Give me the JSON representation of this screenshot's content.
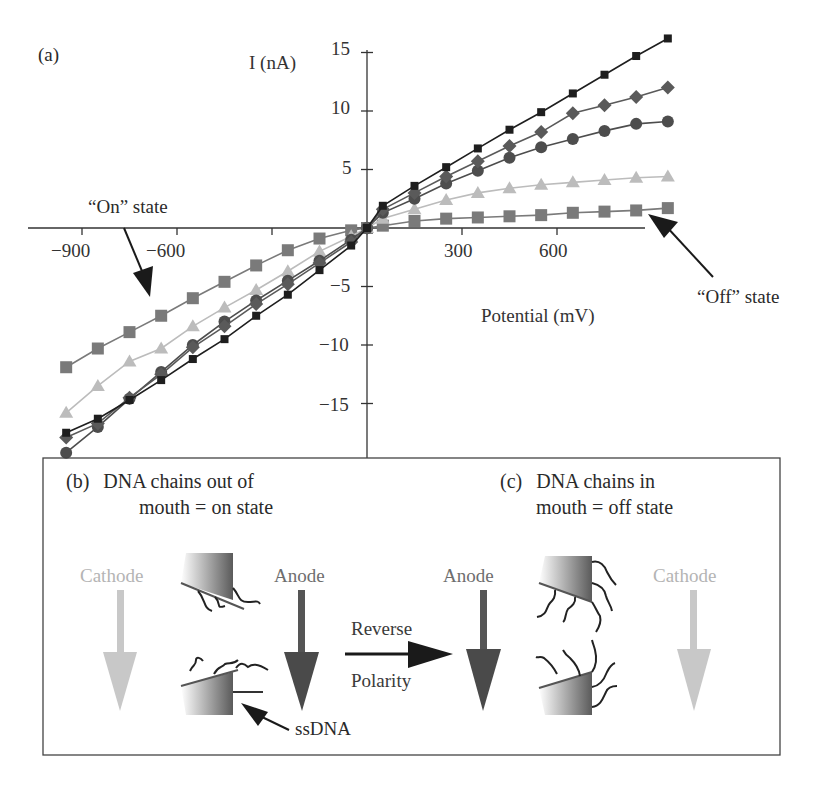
{
  "panel_a": {
    "label": "(a)",
    "y_axis_title": "I (nA)",
    "x_axis_title": "Potential (mV)",
    "y_ticks": [
      "15",
      "10",
      "5",
      "−5",
      "−10",
      "−15"
    ],
    "x_ticks": [
      "−900",
      "−600",
      "300",
      "600"
    ],
    "annotation_on": "“On” state",
    "annotation_off": "“Off” state"
  },
  "panel_b": {
    "label": "(b)",
    "title_line1": "DNA chains out of",
    "title_line2": "mouth = on state",
    "cathode_label": "Cathode",
    "anode_label": "Anode",
    "ssdna_label": "ssDNA"
  },
  "middle": {
    "reverse_label": "Reverse",
    "polarity_label": "Polarity"
  },
  "panel_c": {
    "label": "(c)",
    "title_line1": "DNA chains in",
    "title_line2": "mouth = off state",
    "anode_label": "Anode",
    "cathode_label": "Cathode"
  },
  "colors": {
    "series_black_square": "#1e1e1e",
    "series_diamond": "#5a5a5a",
    "series_circle": "#4d4d4d",
    "series_triangle": "#bcbcbc",
    "series_gray_square": "#7a7a7a",
    "cathode": "#c4c4c4",
    "anode": "#4a4a4a",
    "axis": "#333333"
  },
  "chart_data": {
    "type": "line",
    "title": "",
    "xlabel": "Potential (mV)",
    "ylabel": "I (nA)",
    "xlim": [
      -960,
      960
    ],
    "ylim": [
      -20,
      16
    ],
    "x_ticks": [
      -900,
      -600,
      300,
      600
    ],
    "y_ticks": [
      15,
      10,
      5,
      -5,
      -10,
      -15
    ],
    "grid": false,
    "legend": "none",
    "annotations": [
      {
        "text": "“On” state",
        "points_to": "negative-potential branch"
      },
      {
        "text": "“Off” state",
        "points_to": "gray-square series at positive potential"
      }
    ],
    "x": [
      -950,
      -850,
      -750,
      -650,
      -550,
      -450,
      -350,
      -250,
      -150,
      -50,
      0,
      50,
      150,
      250,
      350,
      450,
      550,
      650,
      750,
      850,
      950
    ],
    "series": [
      {
        "name": "black squares",
        "marker": "square-small",
        "color": "#1e1e1e",
        "values": [
          -17.5,
          -16.3,
          -14.7,
          -13.0,
          -11.2,
          -9.5,
          -7.5,
          -5.7,
          -3.6,
          -1.5,
          0,
          1.9,
          3.6,
          5.2,
          6.8,
          8.4,
          9.9,
          11.5,
          13.1,
          14.7,
          16.2
        ]
      },
      {
        "name": "diamonds",
        "marker": "diamond",
        "color": "#5a5a5a",
        "values": [
          -17.9,
          -16.7,
          -14.5,
          -12.5,
          -10.2,
          -8.4,
          -6.5,
          -4.8,
          -3.0,
          -1.2,
          0,
          1.6,
          3.0,
          4.4,
          5.7,
          7.0,
          8.2,
          9.8,
          10.5,
          11.2,
          12.0
        ]
      },
      {
        "name": "circles",
        "marker": "circle",
        "color": "#4d4d4d",
        "values": [
          -19.2,
          -17.0,
          -14.6,
          -12.3,
          -10.0,
          -8.0,
          -6.2,
          -4.5,
          -2.8,
          -1.0,
          0,
          1.3,
          2.5,
          3.8,
          4.9,
          6.0,
          6.9,
          7.6,
          8.3,
          8.9,
          9.1
        ]
      },
      {
        "name": "triangles",
        "marker": "triangle",
        "color": "#bcbcbc",
        "values": [
          -15.8,
          -13.5,
          -11.4,
          -10.3,
          -8.4,
          -6.8,
          -5.3,
          -3.7,
          -2.0,
          -0.7,
          0,
          0.8,
          1.6,
          2.4,
          3.0,
          3.4,
          3.7,
          3.9,
          4.1,
          4.3,
          4.4
        ]
      },
      {
        "name": "gray squares",
        "marker": "square-large",
        "color": "#7a7a7a",
        "values": [
          -11.9,
          -10.3,
          -8.9,
          -7.5,
          -6.0,
          -4.6,
          -3.2,
          -1.9,
          -0.9,
          -0.2,
          0,
          0.2,
          0.6,
          0.8,
          0.9,
          1.0,
          1.1,
          1.3,
          1.4,
          1.5,
          1.7
        ]
      }
    ]
  }
}
